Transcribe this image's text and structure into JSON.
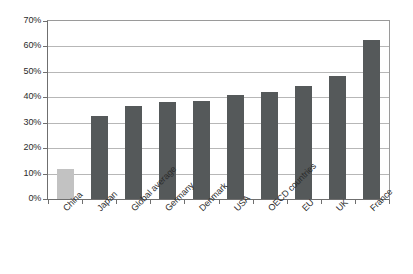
{
  "chart_data": {
    "type": "bar",
    "title": "",
    "subtitle": "",
    "xlabel": "",
    "ylabel": "",
    "categories": [
      "China",
      "Japan",
      "Global average",
      "Germany",
      "Denmark",
      "USA",
      "OECD countries",
      "EU",
      "UK",
      "France"
    ],
    "values": [
      12,
      32.5,
      36.5,
      38,
      38.5,
      41,
      42,
      44.5,
      48.5,
      62.5
    ],
    "value_unit": "%",
    "ylim": [
      0,
      70
    ],
    "ytick_labels": [
      "0%",
      "10%",
      "20%",
      "30%",
      "40%",
      "50%",
      "60%",
      "70%"
    ],
    "ytick_values": [
      0,
      10,
      20,
      30,
      40,
      50,
      60,
      70
    ],
    "grid": true,
    "legend": "none",
    "bar_colors": [
      "#c2c2c2",
      "#55595a",
      "#55595a",
      "#55595a",
      "#55595a",
      "#55595a",
      "#55595a",
      "#55595a",
      "#55595a",
      "#55595a"
    ],
    "highlight_category": "China",
    "highlight_color": "#c2c2c2",
    "series_color": "#55595a",
    "gridline_color": "#b7b7b7",
    "axis_color": "#6f6f6f",
    "background_color": "#ffffff",
    "xlabel_rotation_deg": -45
  }
}
